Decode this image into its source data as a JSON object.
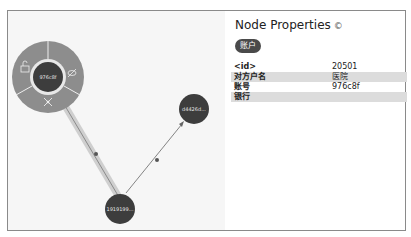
{
  "graph": {
    "nodes": [
      {
        "id": "n1",
        "label": "976c8f",
        "selected": true
      },
      {
        "id": "n2",
        "label": "d4426d..."
      },
      {
        "id": "n3",
        "label": "1919199..."
      }
    ],
    "edges": [
      {
        "from": "n3",
        "to": "n1",
        "label": "转",
        "highlighted": true
      },
      {
        "from": "n3",
        "to": "n2",
        "label": "转"
      }
    ],
    "ring_menu": {
      "items": [
        {
          "name": "unlock",
          "icon": "unlock-icon"
        },
        {
          "name": "hide",
          "icon": "eye-slash-icon"
        },
        {
          "name": "expand",
          "icon": "expand-icon"
        }
      ]
    }
  },
  "properties": {
    "title": "Node Properties",
    "info_icon": "©",
    "badge": "账户",
    "rows": [
      {
        "key": "<id>",
        "value": "20501"
      },
      {
        "key": "对方户名",
        "value": "医院"
      },
      {
        "key": "账号",
        "value": "976c8f"
      },
      {
        "key": "银行",
        "value": ""
      }
    ]
  },
  "colors": {
    "node_fill": "#3d3d3d",
    "ring_fill": "#8c8c8c",
    "graph_bg": "#f6f6f6",
    "highlight_edge": "#c8c8c8"
  }
}
